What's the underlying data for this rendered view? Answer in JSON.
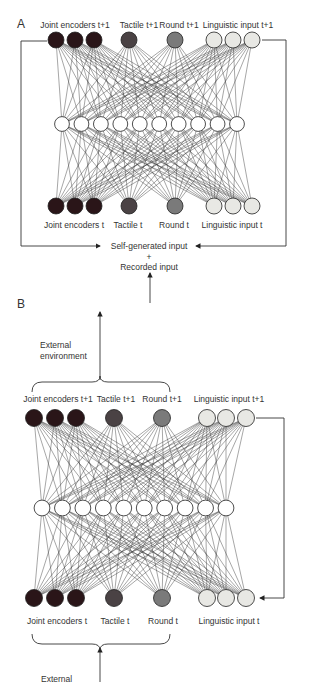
{
  "panels": {
    "A": {
      "label": "A",
      "top_labels": {
        "joint": "Joint encoders t+1",
        "tactile": "Tactile t+1",
        "round": "Round t+1",
        "linguistic": "Linguistic input t+1"
      },
      "bottom_labels": {
        "joint": "Joint encoders t",
        "tactile": "Tactile t",
        "round": "Round t",
        "linguistic": "Linguistic input t"
      },
      "input_text": {
        "line1": "Self-generated input",
        "plus": "+",
        "line2": "Recorded input"
      },
      "hidden_units": 10
    },
    "B": {
      "label": "B",
      "top_labels": {
        "joint": "Joint encoders t+1",
        "tactile": "Tactile t+1",
        "round": "Round t+1",
        "linguistic": "Linguistic input t+1"
      },
      "bottom_labels": {
        "joint": "Joint encoders t",
        "tactile": "Tactile t",
        "round": "Round t",
        "linguistic": "Linguistic input t"
      },
      "external_out": "External environment",
      "external_in": "External",
      "hidden_units": 10
    }
  },
  "colors": {
    "joint": "#2a1518",
    "tactile": "#4a4244",
    "round": "#7a7a7a",
    "linguistic": "#e8e8e4",
    "hidden": "#ffffff",
    "line": "#333333"
  }
}
